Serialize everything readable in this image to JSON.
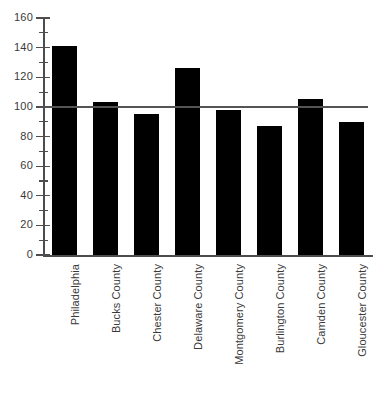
{
  "chart_data": {
    "type": "bar",
    "title": "",
    "subtitle": "",
    "xlabel": "",
    "ylabel": "",
    "ylim": [
      0,
      160
    ],
    "ytick_step": 20,
    "yminor_step": 10,
    "grid": false,
    "legend": null,
    "bar_color": "#000000",
    "axis_color": "#4d4d4d",
    "reference_line": {
      "value": 100,
      "color": "#545454",
      "label": ""
    },
    "categories": [
      "Philadelphia",
      "Bucks County",
      "Chester County",
      "Delaware County",
      "Montgomery County",
      "Burlington County",
      "Camden County",
      "Gloucester County"
    ],
    "values": [
      141,
      103,
      95,
      126,
      98,
      87,
      105,
      90
    ],
    "ytick_labels": [
      "0",
      "20",
      "40",
      "60",
      "80",
      "100",
      "120",
      "140",
      "160"
    ],
    "ytick_values": [
      0,
      20,
      40,
      60,
      80,
      100,
      120,
      140,
      160
    ],
    "yminor_values": [
      10,
      30,
      50,
      70,
      90,
      110,
      130,
      150
    ]
  }
}
